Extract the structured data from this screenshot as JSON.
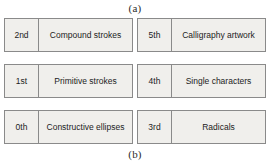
{
  "captions": {
    "top": "(a)",
    "bottom": "(b)"
  },
  "colors": {
    "box_fill": "#f0efec",
    "box_border": "#8a8a8a",
    "text": "#1c1c1c",
    "background": "#ffffff"
  },
  "left_column": {
    "name": "left-hierarchy-column",
    "levels": [
      {
        "index": "2nd",
        "label": "Compound strokes"
      },
      {
        "index": "1st",
        "label": "Primitive strokes"
      },
      {
        "index": "0th",
        "label": "Constructive ellipses"
      }
    ]
  },
  "right_column": {
    "name": "right-hierarchy-column",
    "levels": [
      {
        "index": "5th",
        "label": "Calligraphy artwork"
      },
      {
        "index": "4th",
        "label": "Single characters"
      },
      {
        "index": "3rd",
        "label": "Radicals"
      }
    ]
  }
}
